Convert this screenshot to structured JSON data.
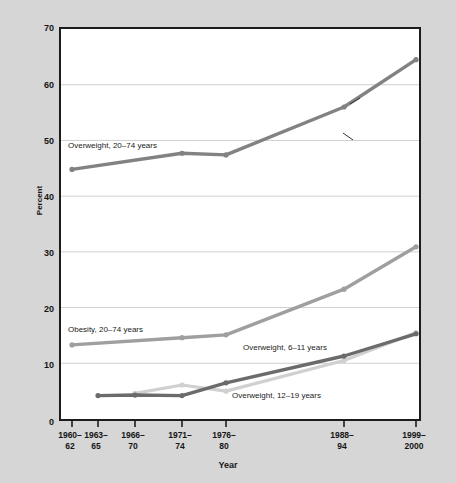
{
  "chart_data": {
    "type": "line",
    "title": "",
    "xlabel": "Year",
    "ylabel": "Percent",
    "ylim": [
      0,
      70
    ],
    "yticks": [
      0,
      10,
      20,
      30,
      40,
      50,
      60,
      70
    ],
    "grid": "horizontal",
    "legend_position": "inline-annotations",
    "categories": [
      "1960–62",
      "1963–65",
      "1966–70",
      "1971–74",
      "1976–80",
      "1988–94",
      "1999–2000"
    ],
    "category_lines": [
      [
        "1960–",
        "62"
      ],
      [
        "1963–",
        "65"
      ],
      [
        "1966–",
        "70"
      ],
      [
        "1971–",
        "74"
      ],
      [
        "1976–",
        "80"
      ],
      [
        "1988–",
        "94"
      ],
      [
        "1999–",
        "2000"
      ]
    ],
    "series": [
      {
        "name": "Overweight, 20–74 years",
        "color": "#828282",
        "values": [
          44.8,
          null,
          null,
          47.7,
          47.4,
          56.0,
          64.5
        ]
      },
      {
        "name": "Obesity, 20–74 years",
        "color": "#9f9f9f",
        "values": [
          13.3,
          null,
          null,
          14.6,
          15.1,
          23.3,
          30.9
        ]
      },
      {
        "name": "Overweight, 6–11 years",
        "color": "#6b6b6b",
        "values": [
          null,
          4.2,
          4.3,
          4.2,
          6.5,
          11.3,
          15.3
        ]
      },
      {
        "name": "Overweight, 12–19 years",
        "color": "#d0d0d0",
        "values": [
          null,
          null,
          4.6,
          6.1,
          5.0,
          10.5,
          15.5
        ]
      }
    ],
    "annotations": [
      {
        "text": "Overweight, 20–74 years",
        "x": 68,
        "y": 141
      },
      {
        "text": "Obesity, 20–74 years",
        "x": 68,
        "y": 325
      },
      {
        "text": "Overweight, 6–11 years",
        "x": 243,
        "y": 343
      },
      {
        "text": "Overweight, 12–19 years",
        "x": 232,
        "y": 391
      }
    ]
  },
  "figure": {
    "background_color": "#d6d6d6",
    "plot_background_color": "#ffffff",
    "border_color": "#1c1c1c",
    "gridline_color": "#cfcfcf"
  }
}
